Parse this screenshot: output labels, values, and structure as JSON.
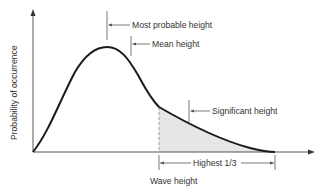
{
  "diagram": {
    "y_axis_label": "Probability of occurrence",
    "x_axis_label": "Wave height",
    "annotations": {
      "most_probable": "Most probable height",
      "mean": "Mean height",
      "significant": "Significant height",
      "highest_third": "Highest 1/3"
    },
    "colors": {
      "curve": "#1a1a1a",
      "axis": "#555555",
      "shade": "#e6e6e6",
      "text": "#333333"
    }
  }
}
